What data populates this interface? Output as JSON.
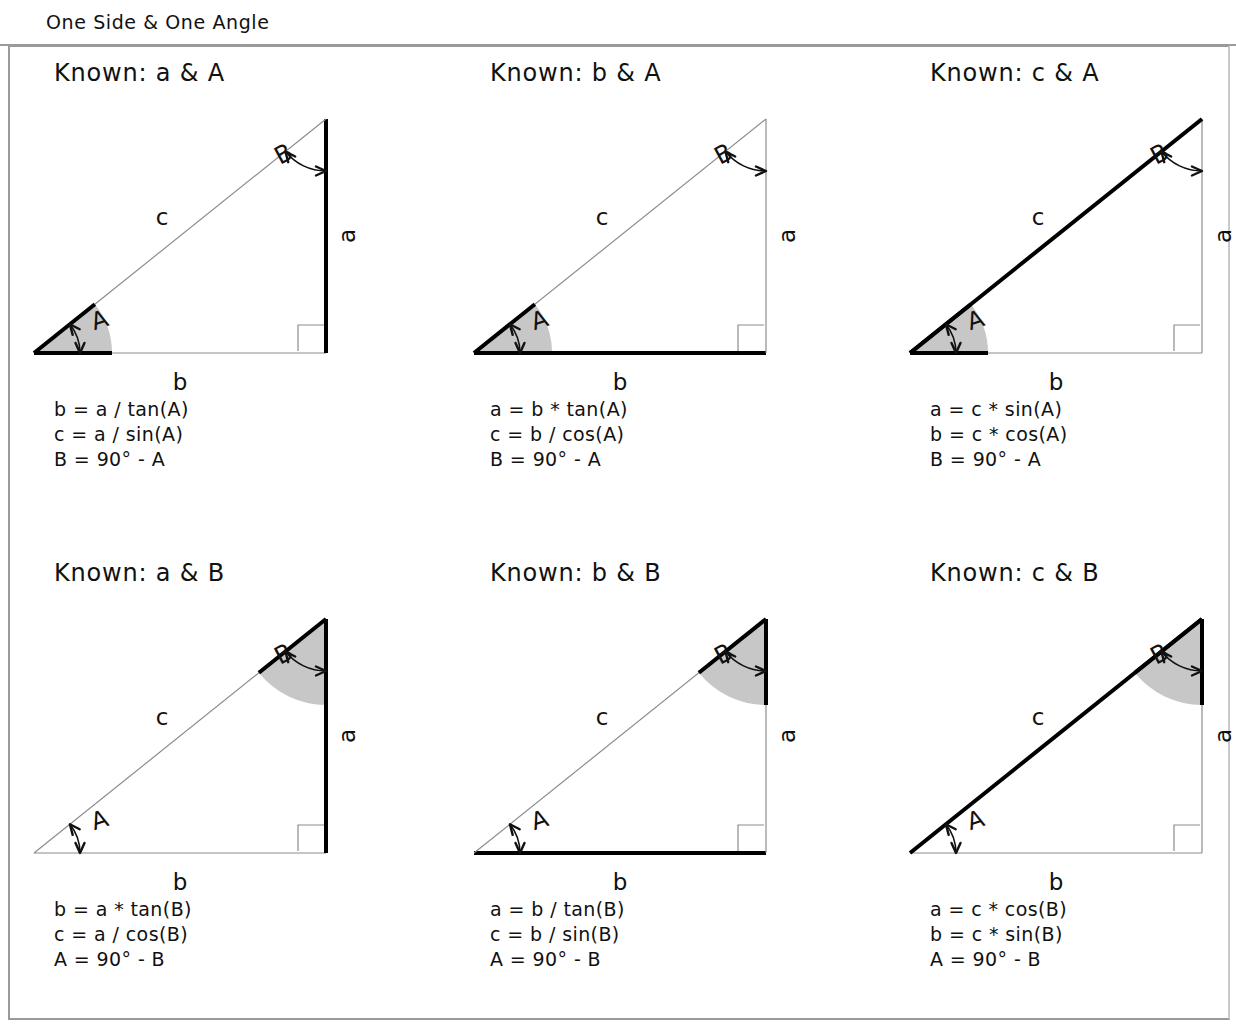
{
  "header": {
    "title": "One Side &  One Angle"
  },
  "figure": {
    "labels": {
      "side_a": "a",
      "side_b": "b",
      "side_c": "c",
      "angle_a": "A",
      "angle_b": "B"
    },
    "colors": {
      "known_stroke": "#000000",
      "unknown_stroke": "#8c8c8c",
      "angle_fill": "#c7c7c7",
      "right_angle_stroke": "#8c8c8c",
      "frame": "#9a9a9a"
    }
  },
  "panels": [
    {
      "id": "known-a-and-A",
      "title": "Known: a & A",
      "known_side": "a",
      "known_angle": "A",
      "formulas": [
        "b = a / tan(A)",
        "c = a / sin(A)",
        "B = 90° - A"
      ]
    },
    {
      "id": "known-b-and-A",
      "title": "Known: b & A",
      "known_side": "b",
      "known_angle": "A",
      "formulas": [
        "a = b * tan(A)",
        "c = b / cos(A)",
        "B = 90° - A"
      ]
    },
    {
      "id": "known-c-and-A",
      "title": "Known: c & A",
      "known_side": "c",
      "known_angle": "A",
      "formulas": [
        "a = c * sin(A)",
        "b = c * cos(A)",
        "B = 90° - A"
      ]
    },
    {
      "id": "known-a-and-B",
      "title": "Known: a & B",
      "known_side": "a",
      "known_angle": "B",
      "formulas": [
        "b = a * tan(B)",
        "c = a / cos(B)",
        "A = 90° - B"
      ]
    },
    {
      "id": "known-b-and-B",
      "title": "Known: b & B",
      "known_side": "b",
      "known_angle": "B",
      "formulas": [
        "a = b / tan(B)",
        "c = b / sin(B)",
        "A = 90° - B"
      ]
    },
    {
      "id": "known-c-and-B",
      "title": "Known: c & B",
      "known_side": "c",
      "known_angle": "B",
      "formulas": [
        "a = c * cos(B)",
        "b = c * sin(B)",
        "A = 90° - B"
      ]
    }
  ],
  "layout": {
    "title_left": [
      46,
      42,
      42
    ],
    "figure_left": [
      8,
      8,
      4
    ],
    "formula_left": [
      46,
      42,
      42
    ],
    "formula_top": [
      352,
      352,
      352
    ]
  }
}
